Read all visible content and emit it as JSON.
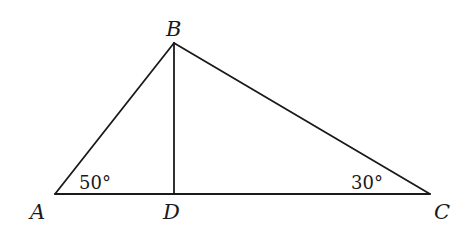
{
  "diagram": {
    "type": "geometry-triangle",
    "points": {
      "A": {
        "label": "A",
        "x": 55,
        "y": 194
      },
      "B": {
        "label": "B",
        "x": 174,
        "y": 43
      },
      "C": {
        "label": "C",
        "x": 430,
        "y": 194
      },
      "D": {
        "label": "D",
        "x": 174,
        "y": 194
      }
    },
    "segments": [
      {
        "name": "AB",
        "from": "A",
        "to": "B"
      },
      {
        "name": "BC",
        "from": "B",
        "to": "C"
      },
      {
        "name": "AC",
        "from": "A",
        "to": "C"
      },
      {
        "name": "BD",
        "from": "B",
        "to": "D"
      }
    ],
    "angles": {
      "A": {
        "text": "50°"
      },
      "C": {
        "text": "30°"
      }
    },
    "stroke_color": "#1a1a1a"
  }
}
